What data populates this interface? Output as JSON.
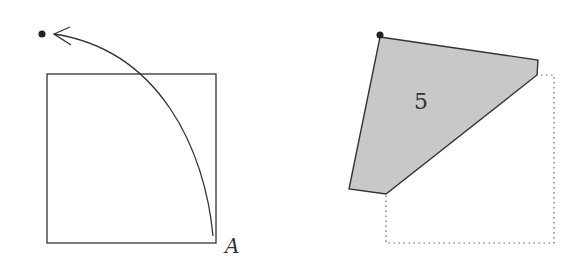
{
  "figure": {
    "left_panel": {
      "square": {
        "x": 47,
        "y": 74,
        "width": 169,
        "height": 169
      },
      "start_point": {
        "cx": 42,
        "cy": 34
      },
      "arc": {
        "from": [
          213,
          236
        ],
        "to": [
          54,
          34
        ],
        "label": "A"
      },
      "label_A": "A"
    },
    "right_panel": {
      "dot": {
        "cx": 380,
        "cy": 35
      },
      "polygon_label": "5",
      "polygon_fill": "#c8c8c8",
      "dotted_square": {
        "x": 386,
        "y": 75,
        "width": 168,
        "height": 168
      }
    },
    "colors": {
      "stroke": "#333333",
      "fill": "#c8c8c8",
      "background": "#ffffff"
    }
  }
}
